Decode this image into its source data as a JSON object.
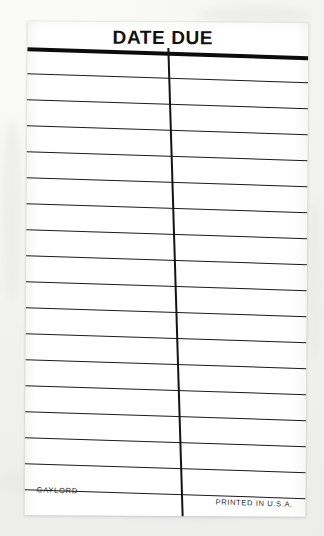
{
  "card": {
    "header_title": "DATE DUE",
    "footer_left": "GAYLORD",
    "footer_right": "PRINTED IN U.S.A.",
    "paper_color": "#ffffff",
    "ink_color": "#1b1b1b",
    "background_color": "#f1f1ef",
    "line_count": 18,
    "column_count": 2,
    "rule_y_positions": [
      26,
      52,
      78,
      104,
      130,
      156,
      182,
      208,
      234,
      260,
      286,
      312,
      338,
      364,
      390,
      416,
      442,
      468
    ],
    "thick_rule_index": 0
  }
}
